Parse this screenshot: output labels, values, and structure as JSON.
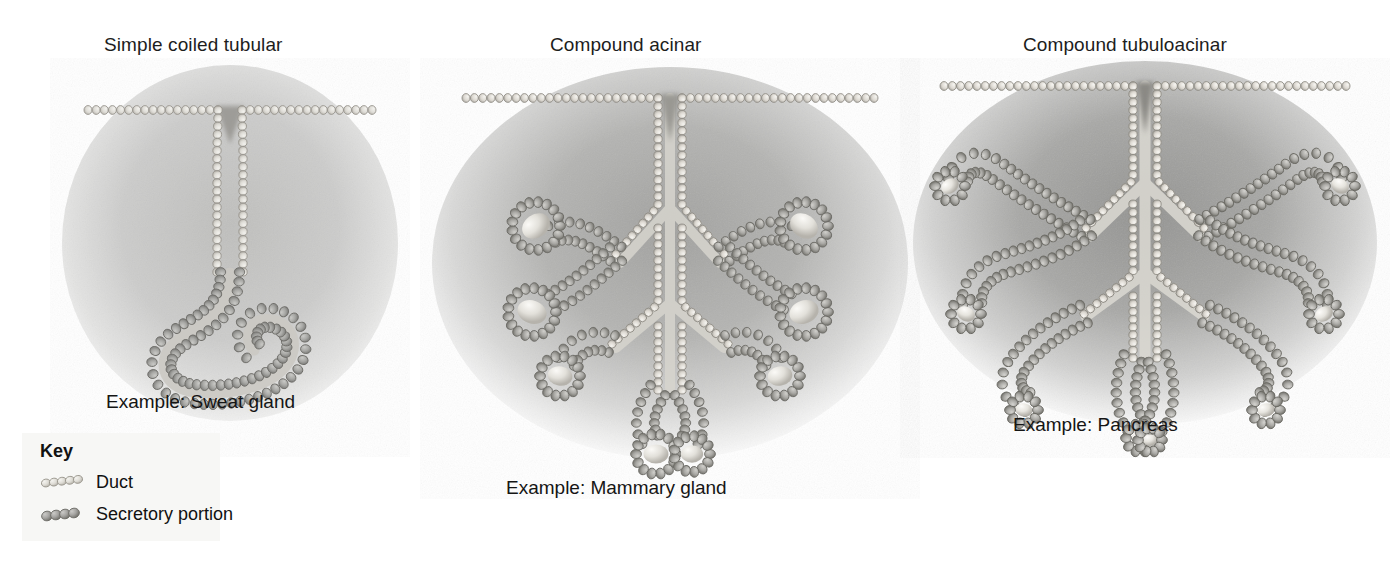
{
  "figure": {
    "background_color": "#ffffff"
  },
  "panels": [
    {
      "id": "simple-coiled-tubular",
      "title": "Simple coiled tubular",
      "example": "Example: Sweat gland",
      "structure": "Unbranched single duct descending from the surface epithelium to a coiled tubular secretory portion"
    },
    {
      "id": "compound-acinar",
      "title": "Compound acinar",
      "example": "Example: Mammary gland",
      "structure": "Branched duct system ending in rounded sac-like acinar secretory units"
    },
    {
      "id": "compound-tubuloacinar",
      "title": "Compound tubuloacinar",
      "example": "Example: Pancreas",
      "structure": "Branched duct system with both tubular and acinar secretory units"
    }
  ],
  "key": {
    "title": "Key",
    "items": [
      {
        "label": "Duct",
        "swatch": "duct-cells-swatch",
        "color": "#d8d6d0"
      },
      {
        "label": "Secretory portion",
        "swatch": "secretory-cells-swatch",
        "color": "#a0a0a0"
      }
    ]
  },
  "colors": {
    "duct_cell_fill": "#e2e0da",
    "duct_cell_stroke": "#9a978f",
    "secretory_cell_fill": "#a6a6a4",
    "secretory_cell_stroke": "#6e6e6c",
    "lumen_highlight": "#f0efeb",
    "vignette_light": "#d2d2d0",
    "vignette_dark": "#8e8e8c",
    "text": "#1d1d1d"
  }
}
